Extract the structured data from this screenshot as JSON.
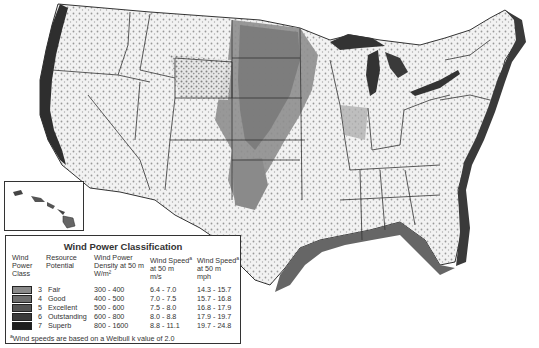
{
  "map": {
    "subject": "United States wind resource map",
    "inset_label": "Hawaii"
  },
  "legend": {
    "title": "Wind Power Classification",
    "headers": {
      "class": [
        "Wind",
        "Power",
        "Class"
      ],
      "resource": [
        "Resource",
        "Potential"
      ],
      "density": [
        "Wind Power",
        "Density at 50 m",
        "W/m²"
      ],
      "speed_ms": [
        "Wind Speed",
        "at 50 m",
        "m/s"
      ],
      "speed_mph": [
        "Wind Speed",
        "at 50 m",
        "mph"
      ],
      "footnote_marker": "a"
    },
    "rows": [
      {
        "class": "3",
        "potential": "Fair",
        "density": "300 - 400",
        "speed_ms": "6.4 - 7.0",
        "speed_mph": "14.3 - 15.7",
        "color": "#8a8a8a"
      },
      {
        "class": "4",
        "potential": "Good",
        "density": "400 - 500",
        "speed_ms": "7.0 - 7.5",
        "speed_mph": "15.7 - 16.8",
        "color": "#6e6e6e"
      },
      {
        "class": "5",
        "potential": "Excellent",
        "density": "500 - 600",
        "speed_ms": "7.5 - 8.0",
        "speed_mph": "16.8 - 17.9",
        "color": "#545454"
      },
      {
        "class": "6",
        "potential": "Outstanding",
        "density": "600 - 800",
        "speed_ms": "8.0 - 8.8",
        "speed_mph": "17.9 - 19.7",
        "color": "#3a3a3a"
      },
      {
        "class": "7",
        "potential": "Superb",
        "density": "800 - 1600",
        "speed_ms": "8.8 - 11.1",
        "speed_mph": "19.7 - 24.8",
        "color": "#1e1e1e"
      }
    ],
    "footnote_marker": "a",
    "footnote": "Wind speeds are based on a Weibull k value of 2.0"
  },
  "colors": {
    "background": "#ffffff",
    "land": "#f4f4f4",
    "plains": "#8c8c8c",
    "coast_offshore": "#4a4a4a",
    "borders": "#333333"
  }
}
